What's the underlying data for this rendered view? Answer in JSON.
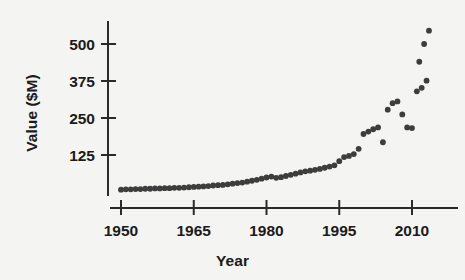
{
  "chart_data": {
    "type": "scatter",
    "title": "",
    "xlabel": "Year",
    "ylabel": "Value ($M)",
    "xlim": [
      1948,
      2014
    ],
    "ylim": [
      0,
      560
    ],
    "xticks": [
      1950,
      1965,
      1980,
      1995,
      2010
    ],
    "xtick_labels": [
      "1950",
      "1965",
      "1980",
      "1995",
      "2010"
    ],
    "yticks": [
      125,
      250,
      375,
      500
    ],
    "ytick_labels": [
      "125",
      "250",
      "375",
      "500"
    ],
    "grid": false,
    "legend": null,
    "marker": {
      "shape": "circle",
      "color": "#3d3d3d",
      "size": 4.6
    },
    "axis_color": "#2b2b2b",
    "background": "#f4f4f2",
    "series": [
      {
        "name": "Value",
        "x": [
          1950,
          1951,
          1952,
          1953,
          1954,
          1955,
          1956,
          1957,
          1958,
          1959,
          1960,
          1961,
          1962,
          1963,
          1964,
          1965,
          1966,
          1967,
          1968,
          1969,
          1970,
          1971,
          1972,
          1973,
          1974,
          1975,
          1976,
          1977,
          1978,
          1979,
          1980,
          1981,
          1982,
          1983,
          1984,
          1985,
          1986,
          1987,
          1988,
          1989,
          1990,
          1991,
          1992,
          1993,
          1994,
          1995,
          1996,
          1997,
          1998,
          1999,
          2000,
          2001,
          2002,
          2003,
          2004,
          2005,
          2006,
          2007,
          2008,
          2009,
          2010,
          2011,
          2012,
          2013
        ],
        "y": [
          8,
          9,
          9,
          10,
          10,
          11,
          11,
          12,
          12,
          13,
          13,
          14,
          14,
          15,
          16,
          17,
          18,
          19,
          20,
          22,
          23,
          24,
          26,
          28,
          30,
          32,
          35,
          38,
          41,
          45,
          49,
          52,
          48,
          50,
          54,
          58,
          62,
          66,
          70,
          72,
          75,
          78,
          82,
          86,
          90,
          104,
          118,
          122,
          128,
          146,
          196,
          204,
          212,
          218,
          168,
          278,
          300,
          306,
          262,
          218,
          216,
          340,
          352,
          376
        ],
        "points_approx": true
      }
    ]
  },
  "extra_points": {
    "x": [
      2011.5,
      2012.5,
      2013.5
    ],
    "y": [
      440,
      500,
      545
    ]
  }
}
